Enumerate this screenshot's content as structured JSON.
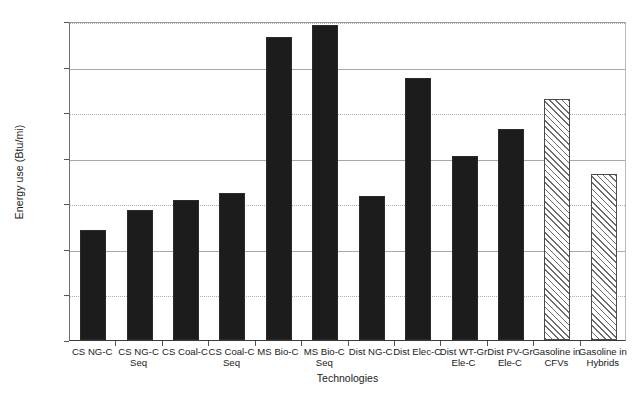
{
  "chart_data": {
    "type": "bar",
    "title": "",
    "xlabel": "Technologies",
    "ylabel": "Energy use (Btu/mi)",
    "ylim": [
      0,
      7000
    ],
    "ytick_interval": 1000,
    "yticks": [
      "0",
      "1000",
      "2000",
      "3000",
      "4000",
      "5000",
      "6000",
      "7000"
    ],
    "grid": "horizontal",
    "legend": "none",
    "categories": [
      "CS NG-C",
      "CS NG-C\nSeq",
      "CS Coal-C",
      "CS Coal-C\nSeq",
      "MS Bio-C",
      "MS Bio-C\nSeq",
      "Dist NG-C",
      "Dist Elec-C",
      "Dist WT-Gr\nEle-C",
      "Dist PV-Gr\nEle-C",
      "Gasoline in\nCFVs",
      "Gasoline in\nHybrids"
    ],
    "values": [
      2420,
      2860,
      3080,
      3230,
      6640,
      6920,
      3160,
      5750,
      4030,
      4620,
      5290,
      3650
    ],
    "fills": [
      "solid",
      "solid",
      "solid",
      "solid",
      "solid",
      "solid",
      "solid",
      "solid",
      "solid",
      "solid",
      "hatched",
      "hatched"
    ],
    "colors": {
      "solid_bar": "#1c1c1c",
      "hatched_bar_line": "#6b6b6b",
      "hatched_bar_bg": "#ffffff",
      "gridline": "#a8a8a8",
      "axis": "#3a3a3a",
      "text": "#1a1a1a",
      "background": "#ffffff"
    }
  }
}
